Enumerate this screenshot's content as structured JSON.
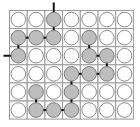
{
  "puzzle": {
    "type": "peg-path-grid",
    "rows": 6,
    "cols": 7,
    "colors": {
      "grid_line": "#9a9a9a",
      "empty_peg_fill": "#ffffff",
      "filled_peg_fill": "#bdbdbd",
      "link": "#111111"
    },
    "filled": [
      [
        0,
        2
      ],
      [
        1,
        0
      ],
      [
        1,
        1
      ],
      [
        1,
        2
      ],
      [
        2,
        0
      ],
      [
        1,
        4
      ],
      [
        2,
        4
      ],
      [
        2,
        5
      ],
      [
        3,
        5
      ],
      [
        3,
        4
      ],
      [
        3,
        3
      ],
      [
        4,
        3
      ],
      [
        5,
        3
      ],
      [
        5,
        2
      ],
      [
        5,
        1
      ],
      [
        4,
        1
      ]
    ],
    "links": [
      [
        [
          0,
          2
        ],
        [
          1,
          2
        ]
      ],
      [
        [
          1,
          0
        ],
        [
          1,
          1
        ]
      ],
      [
        [
          1,
          1
        ],
        [
          1,
          2
        ]
      ],
      [
        [
          1,
          0
        ],
        [
          2,
          0
        ]
      ],
      [
        [
          1,
          4
        ],
        [
          2,
          4
        ]
      ],
      [
        [
          2,
          4
        ],
        [
          2,
          5
        ]
      ],
      [
        [
          2,
          5
        ],
        [
          3,
          5
        ]
      ],
      [
        [
          3,
          3
        ],
        [
          3,
          4
        ]
      ],
      [
        [
          3,
          4
        ],
        [
          3,
          5
        ]
      ],
      [
        [
          3,
          3
        ],
        [
          4,
          3
        ]
      ],
      [
        [
          4,
          3
        ],
        [
          5,
          3
        ]
      ],
      [
        [
          5,
          1
        ],
        [
          5,
          2
        ]
      ],
      [
        [
          5,
          2
        ],
        [
          5,
          3
        ]
      ],
      [
        [
          4,
          1
        ],
        [
          5,
          1
        ]
      ]
    ],
    "stubs": [
      {
        "cell": [
          0,
          2
        ],
        "dir": "up"
      },
      {
        "cell": [
          2,
          0
        ],
        "dir": "left"
      }
    ]
  }
}
